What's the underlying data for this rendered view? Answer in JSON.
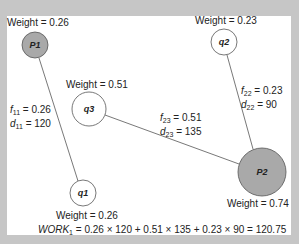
{
  "nodes": [
    {
      "id": "P1",
      "label": "P1",
      "type": "facility",
      "weight_label": "Weight = 0.26",
      "weight": 0.26,
      "cx": 35,
      "cy": 45,
      "r": 13,
      "fill": "#a9a9a9"
    },
    {
      "id": "P2",
      "label": "P2",
      "type": "facility",
      "weight_label": "Weight = 0.74",
      "weight": 0.74,
      "cx": 262,
      "cy": 172,
      "r": 24,
      "fill": "#a9a9a9"
    },
    {
      "id": "q1",
      "label": "q1",
      "type": "demand",
      "weight_label": "Weight = 0.26",
      "weight": 0.26,
      "cx": 83,
      "cy": 193,
      "r": 13,
      "fill": "#ffffff"
    },
    {
      "id": "q2",
      "label": "q2",
      "type": "demand",
      "weight_label": "Weight = 0.23",
      "weight": 0.23,
      "cx": 224,
      "cy": 42,
      "r": 13,
      "fill": "#ffffff"
    },
    {
      "id": "q3",
      "label": "q3",
      "type": "demand",
      "weight_label": "Weight = 0.51",
      "weight": 0.51,
      "cx": 89,
      "cy": 109,
      "r": 17,
      "fill": "#ffffff"
    }
  ],
  "edges": [
    {
      "from": "P1",
      "to": "q1",
      "f_name": "f",
      "f_sub": "11",
      "f_value": "= 0.26",
      "d_name": "d",
      "d_sub": "11",
      "d_value": "= 120"
    },
    {
      "from": "q3",
      "to": "P2",
      "f_name": "f",
      "f_sub": "23",
      "f_value": "= 0.51",
      "d_name": "d",
      "d_sub": "23",
      "d_value": "= 135"
    },
    {
      "from": "q2",
      "to": "P2",
      "f_name": "f",
      "f_sub": "22",
      "f_value": "= 0.23",
      "d_name": "d",
      "d_sub": "22",
      "d_value": "= 90"
    }
  ],
  "formula": {
    "lhs_name": "WORK",
    "lhs_sub": "1",
    "rhs": "= 0.26 × 120 + 0.51 × 135 + 0.23 × 90 = 120.75"
  },
  "colors": {
    "frame": "#c6c6c6",
    "canvas": "#ffffff",
    "facility_fill": "#a9a9a9",
    "stroke": "#555555",
    "text": "#222222"
  }
}
